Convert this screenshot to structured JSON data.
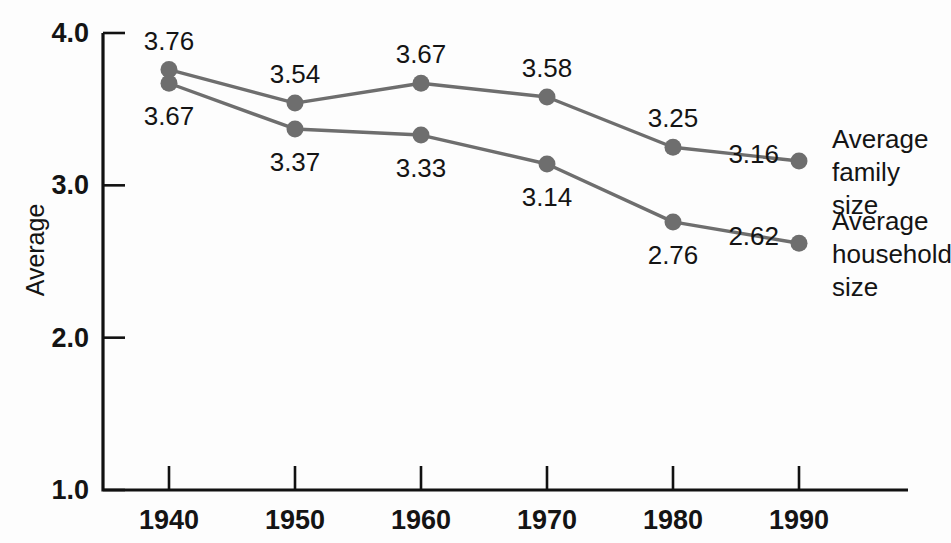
{
  "chart_data": {
    "type": "line",
    "title": "",
    "xlabel": "",
    "ylabel": "Average",
    "categories": [
      "1940",
      "1950",
      "1960",
      "1970",
      "1980",
      "1990"
    ],
    "x": [
      1940,
      1950,
      1960,
      1970,
      1980,
      1990
    ],
    "xlim": [
      1940,
      1990
    ],
    "ylim": [
      1.0,
      4.0
    ],
    "y_ticks": [
      "1.0",
      "2.0",
      "3.0",
      "4.0"
    ],
    "y_tick_values": [
      1.0,
      2.0,
      3.0,
      4.0
    ],
    "grid": false,
    "legend_position": "right-inline",
    "series": [
      {
        "name": "Average family size",
        "label_lines": [
          "Average",
          "family",
          "size"
        ],
        "color": "#6e6e6e",
        "values": [
          3.76,
          3.54,
          3.67,
          3.58,
          3.25,
          3.16
        ],
        "value_labels": [
          "3.76",
          "3.54",
          "3.67",
          "3.58",
          "3.25",
          "3.16"
        ],
        "label_placement": [
          "above",
          "above",
          "above",
          "above",
          "above",
          "left"
        ]
      },
      {
        "name": "Average household size",
        "label_lines": [
          "Average",
          "household",
          "size"
        ],
        "color": "#6e6e6e",
        "values": [
          3.67,
          3.37,
          3.33,
          3.14,
          2.76,
          2.62
        ],
        "value_labels": [
          "3.67",
          "3.37",
          "3.33",
          "3.14",
          "2.76",
          "2.62"
        ],
        "label_placement": [
          "below",
          "below",
          "below",
          "below",
          "below",
          "left"
        ]
      }
    ],
    "colors": {
      "axis": "#111111",
      "text": "#141414",
      "line": "#6e6e6e",
      "background": "#fdfdfd"
    }
  }
}
